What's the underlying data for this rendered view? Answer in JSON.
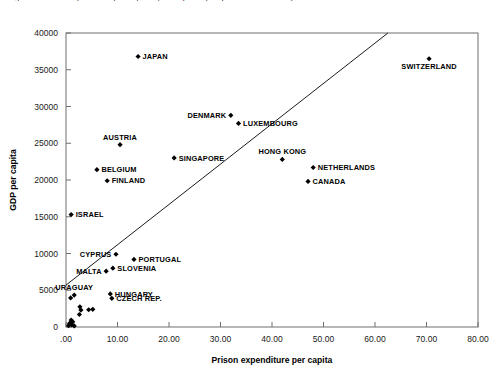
{
  "title_clipped": "Figure 1. Prison expenditure per capita by GDP per capita (selected countries)",
  "chart_data": {
    "type": "scatter",
    "title": "",
    "xlabel": "Prison expenditure per capita",
    "ylabel": "GDP per capita",
    "xlim": [
      0,
      80
    ],
    "ylim": [
      0,
      40000
    ],
    "xticks": [
      0,
      10,
      20,
      30,
      40,
      50,
      60,
      70,
      80
    ],
    "xticklabels": [
      ".00",
      "10.00",
      "20.00",
      "30.00",
      "40.00",
      "50.00",
      "60.00",
      "70.00",
      "80.00"
    ],
    "yticks": [
      0,
      5000,
      10000,
      15000,
      20000,
      25000,
      30000,
      35000,
      40000
    ],
    "yticklabels": [
      "0",
      "5000",
      "10000",
      "15000",
      "20000",
      "25000",
      "30000",
      "35000",
      "40000"
    ],
    "grid": false,
    "legend": "none",
    "marker_color": "#000000",
    "marker_shape": "diamond",
    "trend_line": {
      "present": true,
      "color": "#000000",
      "x_start": 0.0,
      "y_start": 5700,
      "x_end": 62.5,
      "y_end": 40000
    },
    "points": [
      {
        "label": "JAPAN",
        "x": 14.0,
        "y": 36800,
        "label_pos": "right"
      },
      {
        "label": "SWITZERLAND",
        "x": 70.5,
        "y": 36500,
        "label_pos": "below"
      },
      {
        "label": "DENMARK",
        "x": 32.0,
        "y": 28800,
        "label_pos": "left"
      },
      {
        "label": "LUXEMBOURG",
        "x": 33.5,
        "y": 27700,
        "label_pos": "right"
      },
      {
        "label": "AUSTRIA",
        "x": 10.5,
        "y": 24800,
        "label_pos": "above"
      },
      {
        "label": "SINGAPORE",
        "x": 21.0,
        "y": 23000,
        "label_pos": "right"
      },
      {
        "label": "HONG KONG",
        "x": 42.0,
        "y": 22800,
        "label_pos": "above"
      },
      {
        "label": "NETHERLANDS",
        "x": 48.0,
        "y": 21700,
        "label_pos": "right"
      },
      {
        "label": "BELGIUM",
        "x": 6.0,
        "y": 21400,
        "label_pos": "right"
      },
      {
        "label": "FINLAND",
        "x": 8.0,
        "y": 19900,
        "label_pos": "right"
      },
      {
        "label": "CANADA",
        "x": 47.0,
        "y": 19800,
        "label_pos": "right"
      },
      {
        "label": "ISRAEL",
        "x": 1.0,
        "y": 15300,
        "label_pos": "right"
      },
      {
        "label": "CYPRUS",
        "x": 9.7,
        "y": 9900,
        "label_pos": "left"
      },
      {
        "label": "PORTUGAL",
        "x": 13.2,
        "y": 9200,
        "label_pos": "right"
      },
      {
        "label": "SLOVENIA",
        "x": 9.1,
        "y": 8000,
        "label_pos": "right"
      },
      {
        "label": "MALTA",
        "x": 7.8,
        "y": 7600,
        "label_pos": "left"
      },
      {
        "label": "HUNGARY",
        "x": 8.6,
        "y": 4500,
        "label_pos": "right"
      },
      {
        "label": "CZECH REP.",
        "x": 8.9,
        "y": 3900,
        "label_pos": "right"
      },
      {
        "label": "URAGUAY",
        "x": 1.6,
        "y": 4350,
        "label_pos": "above"
      },
      {
        "label": "",
        "x": 0.9,
        "y": 3950,
        "label_pos": "none"
      },
      {
        "label": "",
        "x": 2.7,
        "y": 2750,
        "label_pos": "none"
      },
      {
        "label": "",
        "x": 2.9,
        "y": 2300,
        "label_pos": "none"
      },
      {
        "label": "",
        "x": 4.4,
        "y": 2350,
        "label_pos": "none"
      },
      {
        "label": "",
        "x": 5.2,
        "y": 2400,
        "label_pos": "none"
      },
      {
        "label": "",
        "x": 2.6,
        "y": 1700,
        "label_pos": "none"
      },
      {
        "label": "",
        "x": 1.0,
        "y": 950,
        "label_pos": "none"
      },
      {
        "label": "",
        "x": 1.3,
        "y": 700,
        "label_pos": "none"
      },
      {
        "label": "",
        "x": 0.7,
        "y": 500,
        "label_pos": "none"
      },
      {
        "label": "",
        "x": 1.1,
        "y": 300,
        "label_pos": "none"
      },
      {
        "label": "",
        "x": 0.5,
        "y": 200,
        "label_pos": "none"
      },
      {
        "label": "",
        "x": 1.6,
        "y": 150,
        "label_pos": "none"
      }
    ]
  }
}
